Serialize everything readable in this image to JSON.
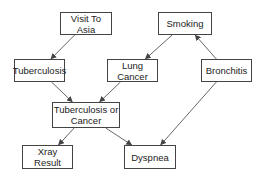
{
  "diagram": {
    "type": "bayesian-network",
    "colors": {
      "line": "#555555",
      "border": "#444444",
      "text": "#222222",
      "background": "#ffffff"
    },
    "nodes": [
      {
        "id": "asia",
        "label": "Visit To Asia",
        "x": 60,
        "y": 12,
        "w": 52,
        "h": 23
      },
      {
        "id": "smoking",
        "label": "Smoking",
        "x": 158,
        "y": 12,
        "w": 54,
        "h": 23
      },
      {
        "id": "tub",
        "label": "Tuberculosis",
        "x": 14,
        "y": 59,
        "w": 51,
        "h": 23
      },
      {
        "id": "lung",
        "label": "Lung Cancer",
        "x": 107,
        "y": 59,
        "w": 51,
        "h": 23
      },
      {
        "id": "bronc",
        "label": "Bronchitis",
        "x": 201,
        "y": 59,
        "w": 51,
        "h": 23
      },
      {
        "id": "either",
        "label": "Tuberculosis or Cancer",
        "line1": "Tuberculosis or",
        "line2": "Cancer",
        "x": 52,
        "y": 102,
        "w": 68,
        "h": 26
      },
      {
        "id": "xray",
        "label": "Xray Result",
        "x": 22,
        "y": 145,
        "w": 51,
        "h": 24
      },
      {
        "id": "dysp",
        "label": "Dyspnea",
        "x": 124,
        "y": 145,
        "w": 52,
        "h": 24
      }
    ],
    "edges": [
      {
        "from": "asia",
        "to": "tub"
      },
      {
        "from": "smoking",
        "to": "lung"
      },
      {
        "from": "bronc",
        "to": "smoking"
      },
      {
        "from": "tub",
        "to": "either"
      },
      {
        "from": "lung",
        "to": "either"
      },
      {
        "from": "either",
        "to": "xray"
      },
      {
        "from": "either",
        "to": "dysp"
      },
      {
        "from": "bronc",
        "to": "dysp"
      }
    ]
  }
}
